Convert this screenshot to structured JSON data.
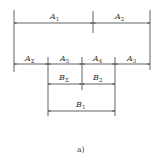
{
  "diagram": {
    "caption": "a)",
    "chains": [
      {
        "row": "top",
        "dimensions": [
          {
            "name": "A",
            "sub": "1"
          },
          {
            "name": "A",
            "sub": "2"
          }
        ]
      },
      {
        "row": "middle",
        "dimensions": [
          {
            "name": "A",
            "sub": "Σ"
          },
          {
            "name": "A",
            "sub": "5"
          },
          {
            "name": "A",
            "sub": "4"
          },
          {
            "name": "A",
            "sub": "3"
          }
        ]
      },
      {
        "row": "lower",
        "dimensions": [
          {
            "name": "B",
            "sub": "Σ"
          },
          {
            "name": "B",
            "sub": "2"
          }
        ]
      },
      {
        "row": "bottom",
        "dimensions": [
          {
            "name": "B",
            "sub": "1"
          }
        ]
      }
    ]
  }
}
